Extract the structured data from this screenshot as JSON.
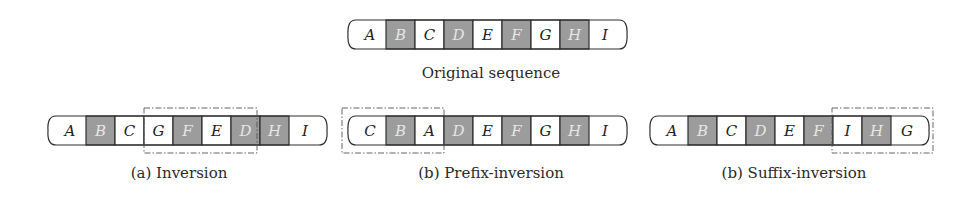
{
  "colors": {
    "shaded_fill": "#9c9c9c",
    "plain_fill": "#ffffff",
    "border": "#2e2e2e",
    "plain_text": "#222222",
    "shaded_text": "#e6e6e6",
    "dash_box": "#555555"
  },
  "sequences": [
    {
      "id": "original",
      "x": 348,
      "y": 20,
      "cells": [
        {
          "label": "A",
          "shaded": false
        },
        {
          "label": "B",
          "shaded": true
        },
        {
          "label": "C",
          "shaded": false
        },
        {
          "label": "D",
          "shaded": true
        },
        {
          "label": "E",
          "shaded": false
        },
        {
          "label": "F",
          "shaded": true
        },
        {
          "label": "G",
          "shaded": false
        },
        {
          "label": "H",
          "shaded": true
        },
        {
          "label": "I",
          "shaded": false
        }
      ],
      "caption": "Original sequence",
      "caption_x": 491,
      "caption_y": 78,
      "highlight": null
    },
    {
      "id": "inversion",
      "x": 48,
      "y": 116,
      "cells": [
        {
          "label": "A",
          "shaded": false
        },
        {
          "label": "B",
          "shaded": true
        },
        {
          "label": "C",
          "shaded": false
        },
        {
          "label": "G",
          "shaded": false
        },
        {
          "label": "F",
          "shaded": true
        },
        {
          "label": "E",
          "shaded": false
        },
        {
          "label": "D",
          "shaded": true
        },
        {
          "label": "H",
          "shaded": true
        },
        {
          "label": "I",
          "shaded": false
        }
      ],
      "caption": "(a) Inversion",
      "caption_x": 179,
      "caption_y": 178,
      "highlight": {
        "x": 144,
        "y": 108,
        "w": 113,
        "h": 45
      }
    },
    {
      "id": "prefix-inversion",
      "x": 348,
      "y": 116,
      "cells": [
        {
          "label": "C",
          "shaded": false
        },
        {
          "label": "B",
          "shaded": true
        },
        {
          "label": "A",
          "shaded": false
        },
        {
          "label": "D",
          "shaded": true
        },
        {
          "label": "E",
          "shaded": false
        },
        {
          "label": "F",
          "shaded": true
        },
        {
          "label": "G",
          "shaded": false
        },
        {
          "label": "H",
          "shaded": true
        },
        {
          "label": "I",
          "shaded": false
        }
      ],
      "caption": "(b) Prefix-inversion",
      "caption_x": 491,
      "caption_y": 178,
      "highlight": {
        "x": 342,
        "y": 108,
        "w": 102,
        "h": 45
      }
    },
    {
      "id": "suffix-inversion",
      "x": 650,
      "y": 116,
      "cells": [
        {
          "label": "A",
          "shaded": false
        },
        {
          "label": "B",
          "shaded": true
        },
        {
          "label": "C",
          "shaded": false
        },
        {
          "label": "D",
          "shaded": true
        },
        {
          "label": "E",
          "shaded": false
        },
        {
          "label": "F",
          "shaded": true
        },
        {
          "label": "I",
          "shaded": false
        },
        {
          "label": "H",
          "shaded": true
        },
        {
          "label": "G",
          "shaded": false
        }
      ],
      "caption": "(b) Suffix-inversion",
      "caption_x": 794,
      "caption_y": 178,
      "highlight": {
        "x": 832,
        "y": 108,
        "w": 101,
        "h": 45
      }
    }
  ],
  "layout": {
    "end_cell_width": 38,
    "cell_width": 29,
    "cell_height": 29,
    "cap_inset": 8
  }
}
